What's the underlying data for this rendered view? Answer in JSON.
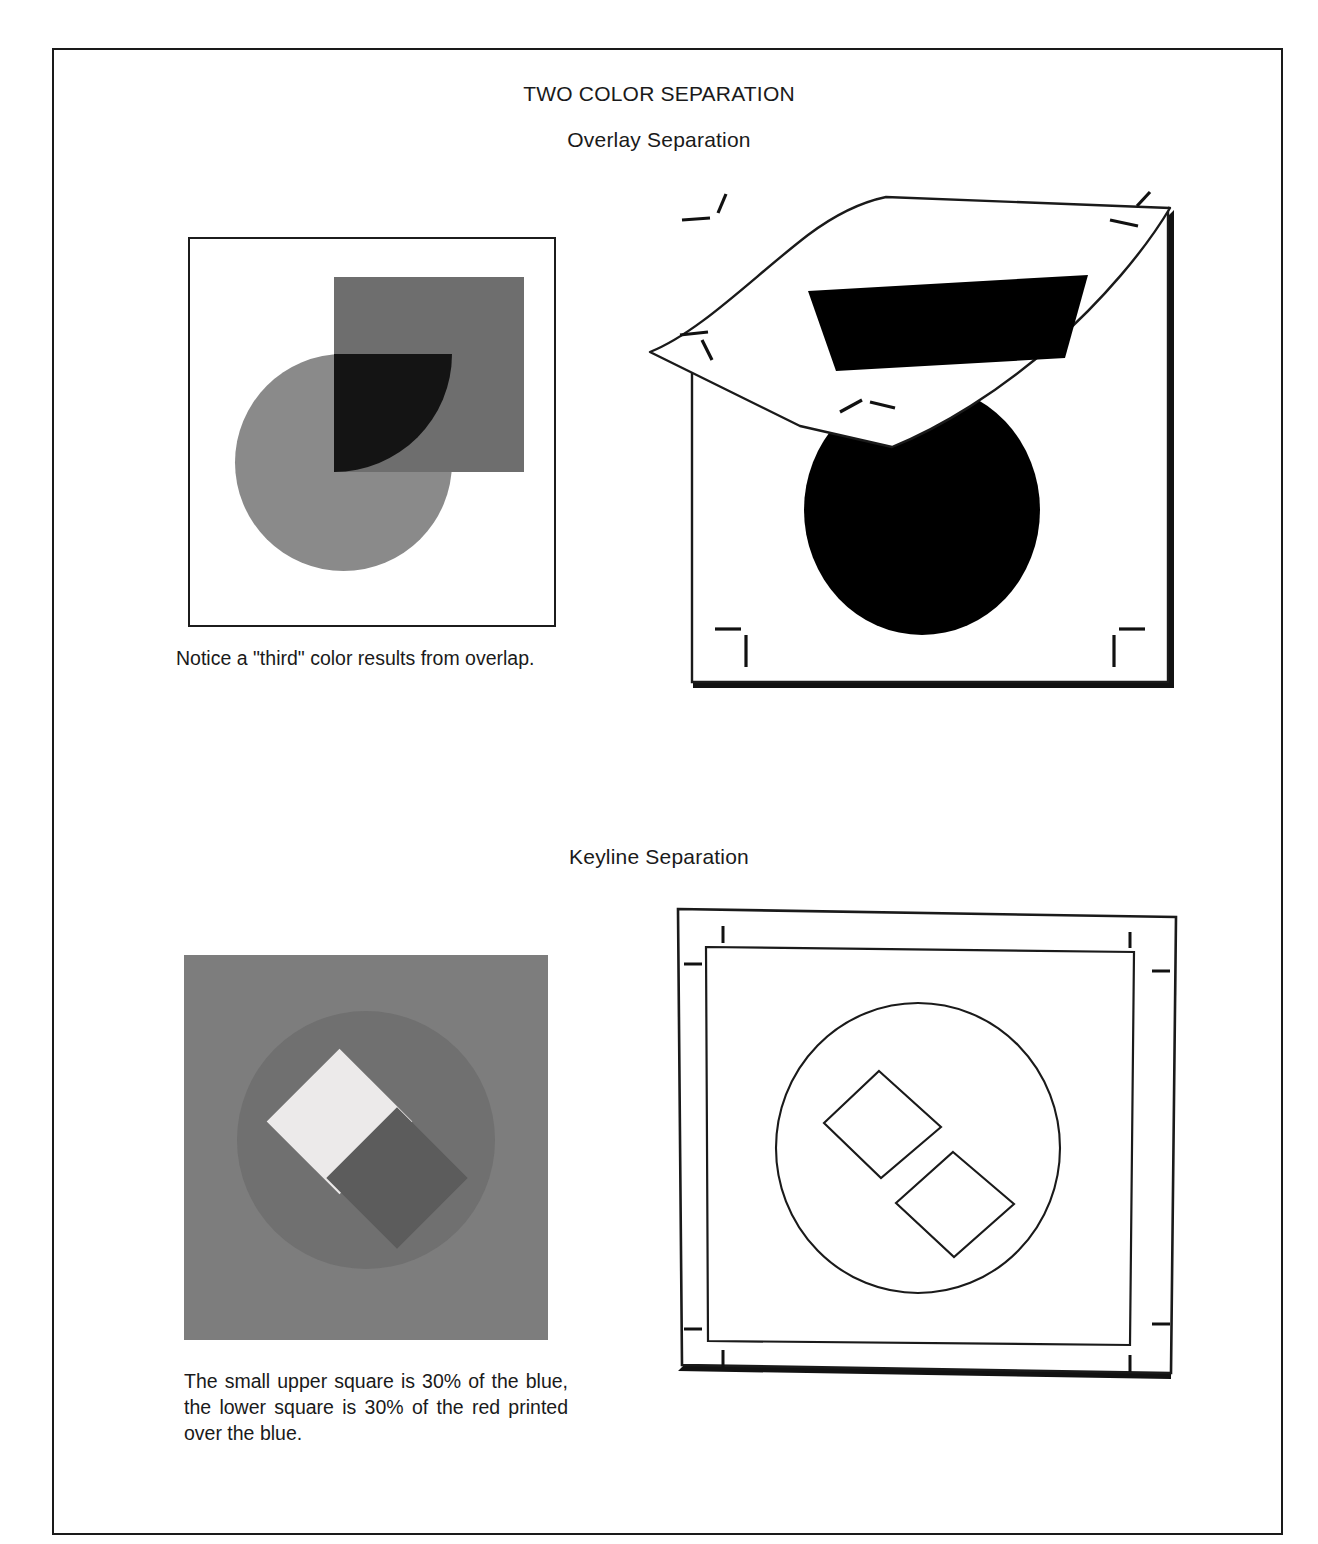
{
  "page": {
    "title": "TWO COLOR SEPARATION",
    "sections": [
      {
        "heading": "Overlay Separation"
      },
      {
        "heading": "Keyline Separation"
      }
    ]
  },
  "captions": {
    "overlay": "Notice a \"third\" color results from overlap.",
    "keyline": "The small upper square is 30% of the blue, the lower square is 30% of the red printed over the blue."
  },
  "figures": {
    "overlap_artwork": {
      "name": "Flat overlap artwork",
      "shapes": [
        {
          "shape": "square",
          "fill": "#6e6e6e",
          "role": "second-color-square"
        },
        {
          "shape": "circle",
          "fill": "#8a8a8a",
          "role": "first-color-circle"
        },
        {
          "shape": "intersection",
          "fill": "#141414",
          "role": "third-color-overlap"
        }
      ]
    },
    "overlay_boards": {
      "name": "Base board with lifted acetate overlay",
      "base_shape": "circle",
      "base_fill": "#000000",
      "overlay_shape": "square",
      "overlay_fill": "#000000",
      "register_marks": 8
    },
    "keyline_artwork": {
      "name": "Keyline color artwork",
      "background_fill": "#7d7d7d",
      "circle_fill": "#707070",
      "upper_square_fill": "#eceaea",
      "lower_square_fill": "#5c5c5c",
      "upper_square_tint": "30%",
      "lower_square_tint": "30%"
    },
    "keyline_lineart": {
      "name": "Keyline line-art boards",
      "outline_shapes": [
        "circle",
        "square",
        "square"
      ],
      "stroke": "#1a1a1a",
      "register_marks": 8
    }
  },
  "colors": {
    "ink": "#1a1a1a",
    "paper": "#ffffff",
    "mid_gray": "#6e6e6e",
    "light_gray": "#8a8a8a",
    "overlap_black": "#141414"
  }
}
